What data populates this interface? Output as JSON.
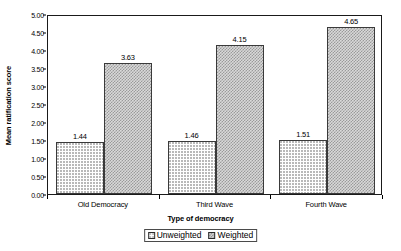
{
  "chart_data": {
    "type": "bar",
    "title": "",
    "xlabel": "Type of democracy",
    "ylabel": "Mean ratification score",
    "categories": [
      "Old Democracy",
      "Third Wave",
      "Fourth Wave"
    ],
    "series": [
      {
        "name": "Unweighted",
        "values": [
          1.44,
          1.46,
          1.51
        ]
      },
      {
        "name": "Weighted",
        "values": [
          3.63,
          4.15,
          4.65
        ]
      }
    ],
    "value_labels": {
      "Unweighted": [
        "1.44",
        "1.46",
        "1.51"
      ],
      "Weighted": [
        "3.63",
        "4.15",
        "4.65"
      ]
    },
    "ylim": [
      0.0,
      5.0
    ],
    "ytick_values": [
      0.0,
      0.5,
      1.0,
      1.5,
      2.0,
      2.5,
      3.0,
      3.5,
      4.0,
      4.5,
      5.0
    ],
    "ytick_labels": [
      "0.00",
      "0.50",
      "1.00",
      "1.50",
      "2.00",
      "2.50",
      "3.00",
      "3.50",
      "4.00",
      "4.50",
      "5.00"
    ],
    "grid": false,
    "legend_position": "bottom",
    "colors": {
      "unweighted_fill": "#ffffff",
      "unweighted_pattern": "#b9b9b9",
      "weighted_fill": "#d9d9d9",
      "weighted_pattern": "#9a9a9a",
      "axis": "#1a1a1a",
      "text": "#000000"
    }
  },
  "legend": {
    "entries": [
      {
        "label": "Unweighted",
        "swatch": "unweighted"
      },
      {
        "label": "Weighted",
        "swatch": "weighted"
      }
    ]
  }
}
